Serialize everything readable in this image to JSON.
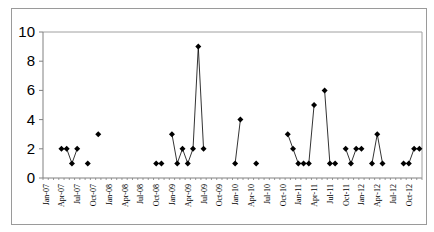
{
  "chart_data": {
    "type": "line",
    "title": "",
    "xlabel": "",
    "ylabel": "",
    "ylim": [
      0,
      10
    ],
    "yticks": [
      0,
      2,
      4,
      6,
      8,
      10
    ],
    "grid": false,
    "legend": null,
    "x_start": "Jan-07",
    "x_end": "Dec-12",
    "xtick_labels": [
      "Jan-07",
      "Apr-07",
      "Jul-07",
      "Oct-07",
      "Jan-08",
      "Apr-08",
      "Jul-08",
      "Oct-08",
      "Jan-09",
      "Apr-09",
      "Jul-09",
      "Oct-09",
      "Jan-10",
      "Apr-10",
      "Jul-10",
      "Oct-10",
      "Jan-11",
      "Apr-11",
      "Jul-11",
      "Oct-11",
      "Jan-12",
      "Apr-12",
      "Jul-12",
      "Oct-12"
    ],
    "marker": "diamond",
    "line_color": "#000000",
    "series": [
      {
        "name": "count",
        "points": [
          {
            "x": "Apr-07",
            "y": 2
          },
          {
            "x": "May-07",
            "y": 2
          },
          {
            "x": "Jun-07",
            "y": 1
          },
          {
            "x": "Jul-07",
            "y": 2
          },
          {
            "x": "Sep-07",
            "y": 1
          },
          {
            "x": "Nov-07",
            "y": 3
          },
          {
            "x": "Oct-08",
            "y": 1
          },
          {
            "x": "Nov-08",
            "y": 1
          },
          {
            "x": "Jan-09",
            "y": 3
          },
          {
            "x": "Feb-09",
            "y": 1
          },
          {
            "x": "Mar-09",
            "y": 2
          },
          {
            "x": "Apr-09",
            "y": 1
          },
          {
            "x": "May-09",
            "y": 2
          },
          {
            "x": "Jun-09",
            "y": 9
          },
          {
            "x": "Jul-09",
            "y": 2
          },
          {
            "x": "Jan-10",
            "y": 1
          },
          {
            "x": "Feb-10",
            "y": 4
          },
          {
            "x": "May-10",
            "y": 1
          },
          {
            "x": "Nov-10",
            "y": 3
          },
          {
            "x": "Dec-10",
            "y": 2
          },
          {
            "x": "Jan-11",
            "y": 1
          },
          {
            "x": "Feb-11",
            "y": 1
          },
          {
            "x": "Mar-11",
            "y": 1
          },
          {
            "x": "Apr-11",
            "y": 5
          },
          {
            "x": "Jun-11",
            "y": 6
          },
          {
            "x": "Jul-11",
            "y": 1
          },
          {
            "x": "Aug-11",
            "y": 1
          },
          {
            "x": "Oct-11",
            "y": 2
          },
          {
            "x": "Nov-11",
            "y": 1
          },
          {
            "x": "Dec-11",
            "y": 2
          },
          {
            "x": "Jan-12",
            "y": 2
          },
          {
            "x": "Mar-12",
            "y": 1
          },
          {
            "x": "Apr-12",
            "y": 3
          },
          {
            "x": "May-12",
            "y": 1
          },
          {
            "x": "Sep-12",
            "y": 1
          },
          {
            "x": "Oct-12",
            "y": 1
          },
          {
            "x": "Nov-12",
            "y": 2
          },
          {
            "x": "Dec-12",
            "y": 2
          }
        ]
      }
    ]
  }
}
